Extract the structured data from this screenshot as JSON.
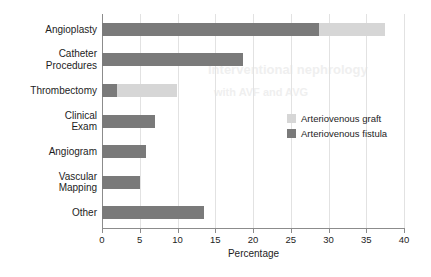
{
  "chart_data": {
    "type": "bar",
    "orientation": "horizontal",
    "stacked": true,
    "title": "",
    "xlabel": "Percentage",
    "ylabel": "",
    "xlim": [
      0,
      40
    ],
    "xticks": [
      0,
      5,
      10,
      15,
      20,
      25,
      30,
      35,
      40
    ],
    "xtick_labels": [
      "0",
      "5",
      "10",
      "15",
      "20",
      "25",
      "30",
      "35",
      "40"
    ],
    "grid": true,
    "legend_position": "center-right",
    "categories": [
      "Angioplasty",
      "Catheter\nProcedures",
      "Thrombectomy",
      "Clinical\nExam",
      "Angiogram",
      "Vascular\nMapping",
      "Other"
    ],
    "series": [
      {
        "name": "Arteriovenous fistula",
        "color": "#7a7a7a",
        "values": [
          28.8,
          18.7,
          2.0,
          7.0,
          5.8,
          5.0,
          13.5
        ]
      },
      {
        "name": "Arteriovenous graft",
        "color": "#d6d6d6",
        "values": [
          8.7,
          0,
          8.0,
          0,
          0,
          0,
          0
        ]
      }
    ]
  },
  "legend": {
    "items": [
      {
        "label": "Arteriovenous graft",
        "color": "#d6d6d6"
      },
      {
        "label": "Arteriovenous fistula",
        "color": "#7a7a7a"
      }
    ]
  },
  "artifacts": {
    "bleed_1": "Interventional nephrology",
    "bleed_2": "with AVF and AVG"
  }
}
